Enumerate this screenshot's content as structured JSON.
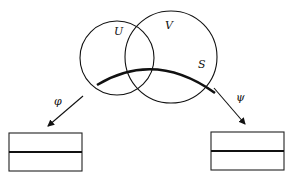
{
  "diagram": {
    "sets": [
      {
        "id": "U",
        "label": "U"
      },
      {
        "id": "V",
        "label": "V"
      }
    ],
    "curve": {
      "label": "S"
    },
    "maps": [
      {
        "id": "phi",
        "label": "φ",
        "direction": "down-left"
      },
      {
        "id": "psi",
        "label": "ψ",
        "direction": "down-right"
      }
    ],
    "targets": [
      {
        "id": "left-box",
        "sections": 2
      },
      {
        "id": "right-box",
        "sections": 2
      }
    ],
    "colors": {
      "stroke": "#111111",
      "background": "#ffffff"
    }
  }
}
